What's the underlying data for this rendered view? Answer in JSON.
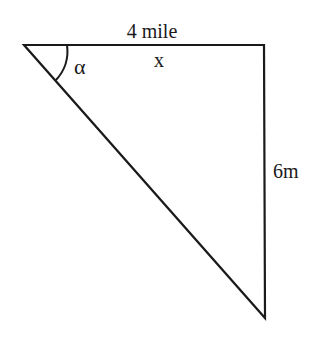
{
  "diagram": {
    "type": "right-triangle",
    "labels": {
      "top_side": "4 mile",
      "top_side_variable": "x",
      "right_side": "6m",
      "angle": "α"
    },
    "vertices": {
      "top_left": [
        24,
        45
      ],
      "top_right": [
        264,
        45
      ],
      "bottom": [
        265,
        318
      ]
    },
    "stroke_color": "#1a1a1a",
    "background": "#ffffff"
  }
}
